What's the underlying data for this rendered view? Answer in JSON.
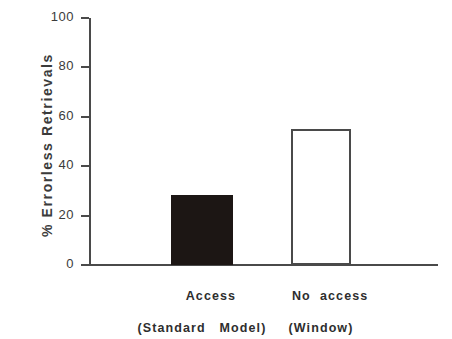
{
  "chart_data": {
    "type": "bar",
    "title": "",
    "xlabel": "",
    "ylabel": "%  Errorless  Retrievals",
    "categories": [
      "Access",
      "No  access"
    ],
    "category_sublabels": [
      "(Standard   Model)",
      "(Window)"
    ],
    "values": [
      28.5,
      55
    ],
    "ylim": [
      0,
      100
    ],
    "yticks": [
      0,
      20,
      40,
      60,
      80,
      100
    ],
    "ytick_labels": [
      "0",
      "20",
      "40",
      "60",
      "80",
      "100"
    ],
    "grid": false,
    "legend": "none",
    "series": [
      {
        "name": "% Errorless Retrievals",
        "values": [
          28.5,
          55
        ],
        "bar_styles": [
          "filled",
          "open"
        ]
      }
    ],
    "colors": {
      "bar_filled": "#1c1614",
      "bar_open_fill": "#ffffff",
      "bar_open_border": "#4a4a4a",
      "axis": "#4a4a4a",
      "text": "#3b3b3b",
      "background": "#ffffff"
    }
  },
  "axis": {
    "y_title": "%  Errorless  Retrievals"
  }
}
